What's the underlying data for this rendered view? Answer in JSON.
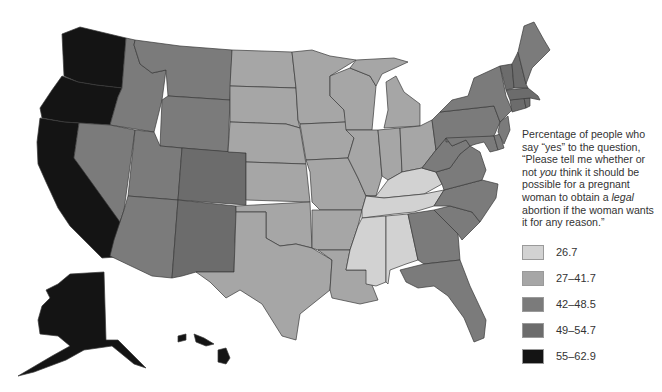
{
  "map": {
    "type": "choropleth",
    "region": "United States",
    "tiers": {
      "t1": {
        "label": "26.7",
        "color": "#d2d2d2"
      },
      "t2": {
        "label": "27–41.7",
        "color": "#a6a6a6"
      },
      "t3": {
        "label": "42–48.5",
        "color": "#7b7b7b"
      },
      "t4": {
        "label": "49–54.7",
        "color": "#6c6c6c"
      },
      "t5": {
        "label": "55–62.9",
        "color": "#141414"
      }
    },
    "states": {
      "Washington": "t5",
      "Oregon": "t5",
      "California": "t5",
      "Alaska": "t5",
      "Hawaii": "t5",
      "Idaho": "t3",
      "Montana": "t3",
      "Wyoming": "t3",
      "Nevada": "t3",
      "Utah": "t3",
      "Colorado": "t4",
      "Arizona": "t3",
      "New Mexico": "t4",
      "North Dakota": "t2",
      "South Dakota": "t2",
      "Nebraska": "t2",
      "Kansas": "t2",
      "Oklahoma": "t2",
      "Texas": "t2",
      "Minnesota": "t2",
      "Iowa": "t2",
      "Missouri": "t2",
      "Arkansas": "t2",
      "Louisiana": "t2",
      "Wisconsin": "t2",
      "Illinois": "t2",
      "Michigan": "t2",
      "Indiana": "t2",
      "Ohio": "t2",
      "Kentucky": "t1",
      "Tennessee": "t1",
      "Mississippi": "t1",
      "Alabama": "t1",
      "Georgia": "t3",
      "Florida": "t3",
      "South Carolina": "t3",
      "North Carolina": "t3",
      "Virginia": "t3",
      "West Virginia": "t3",
      "Pennsylvania": "t3",
      "New York": "t3",
      "Maryland": "t3",
      "Delaware": "t3",
      "New Jersey": "t3",
      "Connecticut": "t4",
      "Rhode Island": "t4",
      "Massachusetts": "t4",
      "Vermont": "t4",
      "New Hampshire": "t4",
      "Maine": "t3"
    }
  },
  "legend": {
    "title_part1": "Percentage of people who say “yes” to the question, “Please tell me whether or not ",
    "title_em1": "you",
    "title_part2": " think it should be possible for a pregnant woman to obtain a ",
    "title_em2": "legal",
    "title_part3": " abortion if the woman wants it for any reason.”",
    "items": [
      {
        "label": "26.7",
        "color": "#d2d2d2"
      },
      {
        "label": "27–41.7",
        "color": "#a6a6a6"
      },
      {
        "label": "42–48.5",
        "color": "#7b7b7b"
      },
      {
        "label": "49–54.7",
        "color": "#6c6c6c"
      },
      {
        "label": "55–62.9",
        "color": "#141414"
      }
    ]
  }
}
